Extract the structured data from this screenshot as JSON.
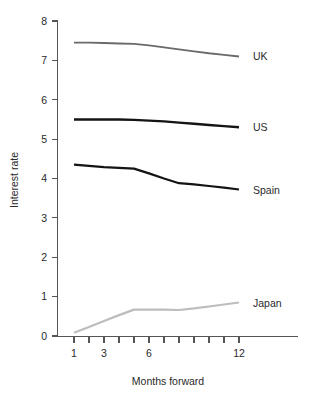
{
  "chart_data": {
    "type": "line",
    "title": "",
    "xlabel": "Months forward",
    "ylabel": "Interest rate",
    "x": [
      1,
      2,
      3,
      4,
      5,
      6,
      7,
      8,
      9,
      10,
      11,
      12
    ],
    "xlim": [
      1,
      12
    ],
    "ylim": [
      0,
      8
    ],
    "xticks": [
      1,
      2,
      3,
      4,
      5,
      6,
      7,
      8,
      9,
      10,
      11,
      12
    ],
    "xtick_labels": [
      "1",
      "",
      "3",
      "",
      "",
      "6",
      "",
      "",
      "",
      "",
      "",
      "12"
    ],
    "yticks": [
      0,
      1,
      2,
      3,
      4,
      5,
      6,
      7,
      8
    ],
    "ytick_labels": [
      "0",
      "1",
      "2",
      "3",
      "4",
      "5",
      "6",
      "7",
      "8"
    ],
    "grid": false,
    "legend_position": "right-inline-labels",
    "series": [
      {
        "name": "UK",
        "color": "#6a6a6a",
        "width": 1.9,
        "values": [
          7.45,
          7.45,
          7.44,
          7.43,
          7.42,
          7.38,
          7.33,
          7.28,
          7.23,
          7.18,
          7.14,
          7.1
        ]
      },
      {
        "name": "US",
        "color": "#141414",
        "width": 2.4,
        "values": [
          5.5,
          5.5,
          5.5,
          5.5,
          5.49,
          5.47,
          5.45,
          5.42,
          5.39,
          5.36,
          5.33,
          5.3
        ]
      },
      {
        "name": "Spain",
        "color": "#141414",
        "width": 2.2,
        "values": [
          4.35,
          4.32,
          4.29,
          4.27,
          4.25,
          4.13,
          4.0,
          3.88,
          3.85,
          3.81,
          3.77,
          3.72
        ]
      },
      {
        "name": "Japan",
        "color": "#bdbdbd",
        "width": 2.2,
        "values": [
          0.08,
          0.23,
          0.38,
          0.53,
          0.67,
          0.67,
          0.67,
          0.66,
          0.7,
          0.75,
          0.8,
          0.85
        ]
      }
    ]
  },
  "axes": {
    "y_title": "Interest rate",
    "x_title": "Months forward"
  },
  "colors": {
    "background": "#ffffff",
    "axis": "#555555",
    "text": "#2a2a2a",
    "uk": "#6a6a6a",
    "us": "#141414",
    "spain": "#141414",
    "japan": "#bdbdbd"
  }
}
